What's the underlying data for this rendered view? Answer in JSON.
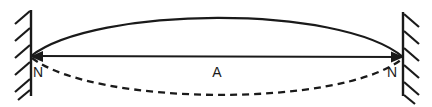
{
  "figure": {
    "background_color": "#ffffff",
    "stroke_color": "#1a1a1a",
    "width": 432,
    "height": 107
  },
  "labels": {
    "node_left": "N",
    "node_right": "N",
    "antinode_center": "A"
  },
  "label_positions": {
    "node_left": {
      "x": 38,
      "y": 73
    },
    "node_right": {
      "x": 392,
      "y": 73
    },
    "antinode_center": {
      "x": 217,
      "y": 73
    }
  },
  "geometry": {
    "left_node": {
      "x": 31,
      "y": 56
    },
    "right_node": {
      "x": 403,
      "y": 57
    },
    "crest_peak": {
      "x": 217,
      "y": 13
    },
    "trough_peak": {
      "x": 217,
      "y": 101
    }
  },
  "walls": {
    "left": {
      "x": 31,
      "y_top": 10,
      "y_bottom": 96,
      "hatch_side": "left",
      "hatch_count": 6
    },
    "right": {
      "x": 403,
      "y_top": 12,
      "y_bottom": 96,
      "hatch_side": "right",
      "hatch_count": 6
    }
  },
  "curves": {
    "crest": {
      "style": "solid",
      "description": "upper extreme displacement of string"
    },
    "equilibrium": {
      "style": "solid",
      "description": "equilibrium axis with arrowheads at both nodes"
    },
    "trough": {
      "style": "dashed",
      "description": "lower extreme displacement of string",
      "dash_pattern": "7 5"
    }
  }
}
